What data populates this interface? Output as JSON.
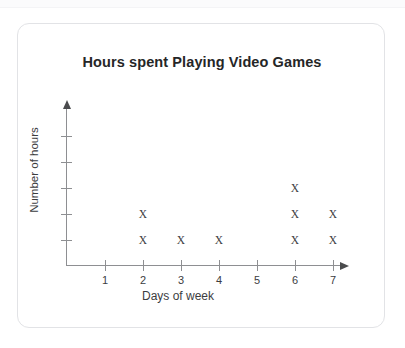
{
  "card": {
    "title": "Hours spent Playing Video Games"
  },
  "chart_data": {
    "type": "scatter",
    "plot_style": "dot-plot-x-marks",
    "title": "Hours spent Playing Video Games",
    "xlabel": "Days of week",
    "ylabel": "Number of hours",
    "categories": [
      "1",
      "2",
      "3",
      "4",
      "5",
      "6",
      "7"
    ],
    "x": [
      1,
      2,
      3,
      4,
      5,
      6,
      7
    ],
    "values": [
      0,
      2,
      1,
      1,
      0,
      3,
      2
    ],
    "marker": "X",
    "marker_color": "#3c3d3f",
    "axis_color": "#8e8f92",
    "xlim": [
      0,
      7.6
    ],
    "ylim": [
      0,
      5
    ],
    "x_tick_labels": [
      "1",
      "2",
      "3",
      "4",
      "5",
      "6",
      "7"
    ],
    "y_tick_labels": [
      "",
      "",
      "",
      "",
      ""
    ],
    "y_tick_count": 5,
    "grid": false,
    "legend": null,
    "x_axis_arrow": true,
    "y_axis_arrow": true,
    "points": [
      {
        "day": 2,
        "level": 1
      },
      {
        "day": 2,
        "level": 2
      },
      {
        "day": 3,
        "level": 1
      },
      {
        "day": 4,
        "level": 1
      },
      {
        "day": 6,
        "level": 1
      },
      {
        "day": 6,
        "level": 2
      },
      {
        "day": 6,
        "level": 3
      },
      {
        "day": 7,
        "level": 1
      },
      {
        "day": 7,
        "level": 2
      }
    ]
  }
}
